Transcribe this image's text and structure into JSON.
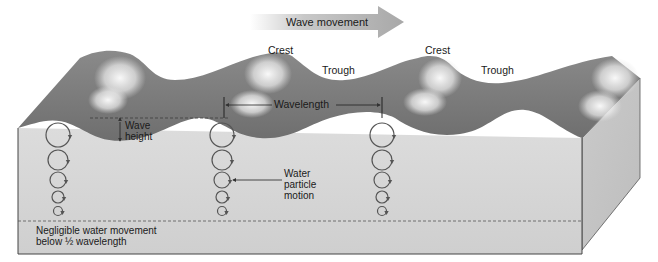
{
  "diagram": {
    "title_arrow": {
      "label": "Wave movement",
      "direction": "right"
    },
    "labels": {
      "crest_1": "Crest",
      "crest_2": "Crest",
      "trough_1": "Trough",
      "trough_2": "Trough",
      "wavelength": "Wavelength",
      "wave_height_line1": "Wave",
      "wave_height_line2": "height",
      "particle_line1": "Water",
      "particle_line2": "particle",
      "particle_line3": "motion",
      "negligible_line1": "Negligible water movement",
      "negligible_line2_prefix": "below ",
      "negligible_fraction": "½",
      "negligible_line2_suffix": " wavelength"
    },
    "colors": {
      "water_surface": "#7d7d7d",
      "water_surface_dark": "#6a6a6a",
      "water_body": "#d2d2d2",
      "water_side": "#c4c4c4",
      "foam": "#f2f2f2",
      "arrow": "#b5b5b5",
      "circle_stroke": "#555555",
      "outline": "#444444"
    },
    "orbit_columns": [
      {
        "x": 58,
        "circles": [
          {
            "cy": 135,
            "r": 12
          },
          {
            "cy": 160,
            "r": 10
          },
          {
            "cy": 180,
            "r": 8
          },
          {
            "cy": 197,
            "r": 6
          },
          {
            "cy": 211,
            "r": 4.5
          }
        ]
      },
      {
        "x": 222,
        "circles": [
          {
            "cy": 135,
            "r": 12
          },
          {
            "cy": 160,
            "r": 10
          },
          {
            "cy": 180,
            "r": 8
          },
          {
            "cy": 197,
            "r": 6
          },
          {
            "cy": 211,
            "r": 4.5
          }
        ]
      },
      {
        "x": 382,
        "circles": [
          {
            "cy": 135,
            "r": 12
          },
          {
            "cy": 160,
            "r": 10
          },
          {
            "cy": 180,
            "r": 8
          },
          {
            "cy": 197,
            "r": 6
          },
          {
            "cy": 211,
            "r": 4.5
          }
        ]
      }
    ]
  }
}
